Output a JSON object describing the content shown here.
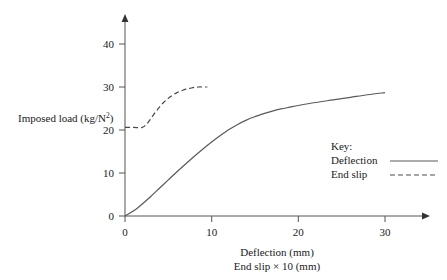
{
  "chart_data": {
    "type": "line",
    "title": "",
    "xlabel": "Deflection (mm)",
    "xlabel_line2": "End slip × 10 (mm)",
    "ylabel": "Imposed load (kg/N",
    "ylabel_sup": "2",
    "ylabel_close": ")",
    "ylabel_full": "Imposed load (kg/N²)",
    "xlim": [
      0,
      35
    ],
    "ylim": [
      0,
      45
    ],
    "xticks": [
      0,
      10,
      20,
      30
    ],
    "xtick_labels": [
      "0",
      "10",
      "20",
      "30"
    ],
    "yticks": [
      0,
      10,
      20,
      30,
      40
    ],
    "ytick_labels": [
      "0",
      "10",
      "20",
      "30",
      "40"
    ],
    "grid": false,
    "legend_position": "right-middle",
    "series": [
      {
        "name": "Deflection",
        "style": "solid",
        "color": "#5a5a5a",
        "x": [
          0,
          1,
          2,
          3,
          4,
          5,
          6,
          7,
          8,
          9,
          10,
          11,
          12,
          13,
          14,
          15,
          16,
          17,
          18,
          19,
          20,
          22,
          24,
          26,
          28,
          30
        ],
        "y": [
          0,
          1.2,
          2.8,
          4.6,
          6.5,
          8.4,
          10.3,
          12.1,
          13.9,
          15.6,
          17.2,
          18.7,
          20.1,
          21.3,
          22.3,
          23.1,
          23.8,
          24.4,
          24.9,
          25.3,
          25.7,
          26.4,
          27.0,
          27.6,
          28.2,
          28.7
        ]
      },
      {
        "name": "End slip",
        "style": "dashed",
        "color": "#4a4a4a",
        "x": [
          0,
          1,
          2,
          2.5,
          3,
          3.5,
          4,
          4.5,
          5,
          5.5,
          6,
          6.5,
          7,
          7.5,
          8,
          8.5,
          9,
          9.5
        ],
        "y": [
          20.6,
          20.6,
          20.6,
          21.4,
          22.7,
          24.1,
          25.4,
          26.5,
          27.4,
          28.1,
          28.7,
          29.1,
          29.5,
          29.7,
          29.9,
          30.0,
          30.0,
          30.0
        ]
      }
    ]
  },
  "legend": {
    "title": "Key:",
    "entries": [
      {
        "label": "Deflection",
        "style": "solid"
      },
      {
        "label": "End slip",
        "style": "dashed"
      }
    ]
  },
  "colors": {
    "axis": "#555555",
    "text": "#1a1a1a",
    "solid_series": "#5a5a5a",
    "dashed_series": "#4a4a4a",
    "background": "#ffffff"
  }
}
